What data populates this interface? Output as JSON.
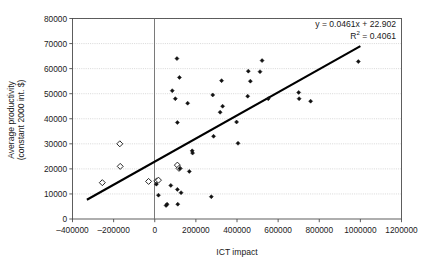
{
  "chart_data": {
    "type": "scatter",
    "title": "",
    "xlabel": "ICT impact",
    "ylabel": "Average productivity (constant 2000 int. $)",
    "ylabel_line1": "Average productivity",
    "ylabel_line2": "(constant 2000 int. $)",
    "xlim": [
      -400000,
      1200000
    ],
    "ylim": [
      0,
      80000
    ],
    "xticks": [
      -400000,
      -200000,
      0,
      200000,
      400000,
      600000,
      800000,
      1000000,
      1200000
    ],
    "xtick_labels": [
      "–400000",
      "–200000",
      "0",
      "200000",
      "400000",
      "600000",
      "800000",
      "1000000",
      "1200000"
    ],
    "yticks": [
      0,
      10000,
      20000,
      30000,
      40000,
      50000,
      60000,
      70000,
      80000
    ],
    "ytick_labels": [
      "0",
      "10000",
      "20000",
      "30000",
      "40000",
      "50000",
      "60000",
      "70000",
      "80000"
    ],
    "grid": true,
    "grid_axis": "y",
    "legend": false,
    "annotations": {
      "equation": "y = 0.0461x + 22.902",
      "r_squared_base": "R",
      "r_squared_exp": "2",
      "r_squared_value": " = 0.4061",
      "r_squared_full": "R2 = 0.4061"
    },
    "trendline": {
      "slope": 0.0461,
      "intercept": 22902,
      "x_start": -330000,
      "x_end": 1000000,
      "y_start": 7689,
      "y_end": 69002,
      "color": "#000000"
    },
    "series": [
      {
        "name": "open-marker-group",
        "marker": "open-diamond",
        "color": "#111111",
        "points": [
          [
            -255000,
            14500
          ],
          [
            -170000,
            30000
          ],
          [
            -168000,
            21000
          ],
          [
            -30000,
            15000
          ],
          [
            10000,
            15200
          ],
          [
            18000,
            15500
          ],
          [
            110000,
            21500
          ],
          [
            118000,
            20200
          ]
        ]
      },
      {
        "name": "filled-marker-group",
        "marker": "filled-diamond",
        "color": "#111111",
        "points": [
          [
            8000,
            13900
          ],
          [
            18000,
            9500
          ],
          [
            55000,
            5400
          ],
          [
            60000,
            5900
          ],
          [
            78000,
            13400
          ],
          [
            85000,
            51200
          ],
          [
            100000,
            48000
          ],
          [
            108000,
            64000
          ],
          [
            110000,
            38500
          ],
          [
            110000,
            11800
          ],
          [
            112000,
            5900
          ],
          [
            120000,
            56500
          ],
          [
            122000,
            20100
          ],
          [
            128000,
            10500
          ],
          [
            160000,
            46200
          ],
          [
            168000,
            19000
          ],
          [
            182000,
            27200
          ],
          [
            184000,
            26300
          ],
          [
            275000,
            8900
          ],
          [
            282000,
            49500
          ],
          [
            286000,
            33000
          ],
          [
            318000,
            42600
          ],
          [
            325000,
            55200
          ],
          [
            330000,
            45000
          ],
          [
            398000,
            38700
          ],
          [
            405000,
            30200
          ],
          [
            452000,
            49000
          ],
          [
            455000,
            59000
          ],
          [
            465000,
            55000
          ],
          [
            512000,
            58800
          ],
          [
            522000,
            63200
          ],
          [
            552000,
            48000
          ],
          [
            700000,
            50500
          ],
          [
            702000,
            48000
          ],
          [
            758000,
            47000
          ],
          [
            990000,
            62800
          ]
        ]
      }
    ]
  }
}
